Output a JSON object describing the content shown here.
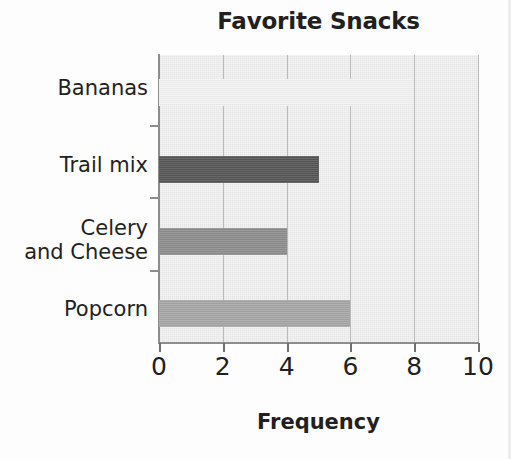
{
  "chart_data": {
    "type": "bar",
    "orientation": "horizontal",
    "title": "Favorite Snacks",
    "xlabel": "Frequency",
    "ylabel": "",
    "categories": [
      "Bananas",
      "Trail mix",
      "Celery\nand Cheese",
      "Popcorn"
    ],
    "values": [
      8,
      5,
      4,
      6
    ],
    "bar_colors": [
      "#f4f4f4",
      "#575757",
      "#8f8f8f",
      "#a8a8a8"
    ],
    "xlim": [
      0,
      10
    ],
    "xticks": [
      0,
      2,
      4,
      6,
      8,
      10
    ],
    "xticklabels": [
      "0",
      "2",
      "4",
      "6",
      "8",
      "10"
    ],
    "grid": "vertical",
    "legend": "none",
    "plot_background": "#ebebeb",
    "axis_color": "#8d8d8d",
    "text_color": "#231f20"
  },
  "bars": [
    {
      "label": "Bananas",
      "value": 8,
      "color": "#f4f4f4",
      "top": 79,
      "height": 27,
      "label_top": 76
    },
    {
      "label": "Trail mix",
      "value": 5,
      "color": "#575757",
      "top": 156,
      "height": 27,
      "label_top": 153
    },
    {
      "label": "Celery\nand Cheese",
      "value": 4,
      "color": "#8f8f8f",
      "top": 228,
      "height": 27,
      "label_top": 216
    },
    {
      "label": "Popcorn",
      "value": 6,
      "color": "#a8a8a8",
      "top": 300,
      "height": 27,
      "label_top": 297
    }
  ],
  "geometry": {
    "plot_left": 159,
    "plot_top": 55,
    "plot_width": 319,
    "plot_height": 287,
    "px_per_unit": 31.9,
    "ytick_positions": [
      55,
      125,
      197,
      270
    ]
  }
}
